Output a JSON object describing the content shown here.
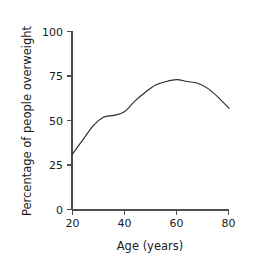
{
  "chart_data": {
    "type": "line",
    "title": "",
    "xlabel": "Age (years)",
    "ylabel": "Percentage of people overweight",
    "xlim": [
      20,
      80
    ],
    "ylim": [
      0,
      100
    ],
    "xticks": [
      20,
      40,
      60,
      80
    ],
    "yticks": [
      0,
      25,
      50,
      75,
      100
    ],
    "xtick_labels": [
      "20",
      "40",
      "60",
      "80"
    ],
    "ytick_labels": [
      "0",
      "25",
      "50",
      "75",
      "100"
    ],
    "grid": false,
    "legend": null,
    "series": [
      {
        "name": "Percentage overweight",
        "color": "#2b2b2b",
        "x": [
          20,
          24,
          28,
          32,
          36,
          40,
          44,
          48,
          52,
          56,
          60,
          64,
          68,
          72,
          76,
          80
        ],
        "values": [
          31,
          39,
          47,
          52,
          53,
          55,
          61,
          66,
          70,
          72,
          73,
          72,
          71,
          68,
          63,
          57
        ]
      }
    ],
    "annotations": []
  },
  "axis": {
    "x_label": "Age (years)",
    "y_label": "Percentage of people overweight"
  },
  "ticks": {
    "y": {
      "t100": "100",
      "t75": "75",
      "t50": "50",
      "t25": "25",
      "t0": "0"
    },
    "x": {
      "t20": "20",
      "t40": "40",
      "t60": "60",
      "t80": "80"
    }
  },
  "colors": {
    "curve": "#2b2b2b",
    "axis": "#4d4d4d",
    "text": "#1a1a1a",
    "background": "#ffffff"
  }
}
